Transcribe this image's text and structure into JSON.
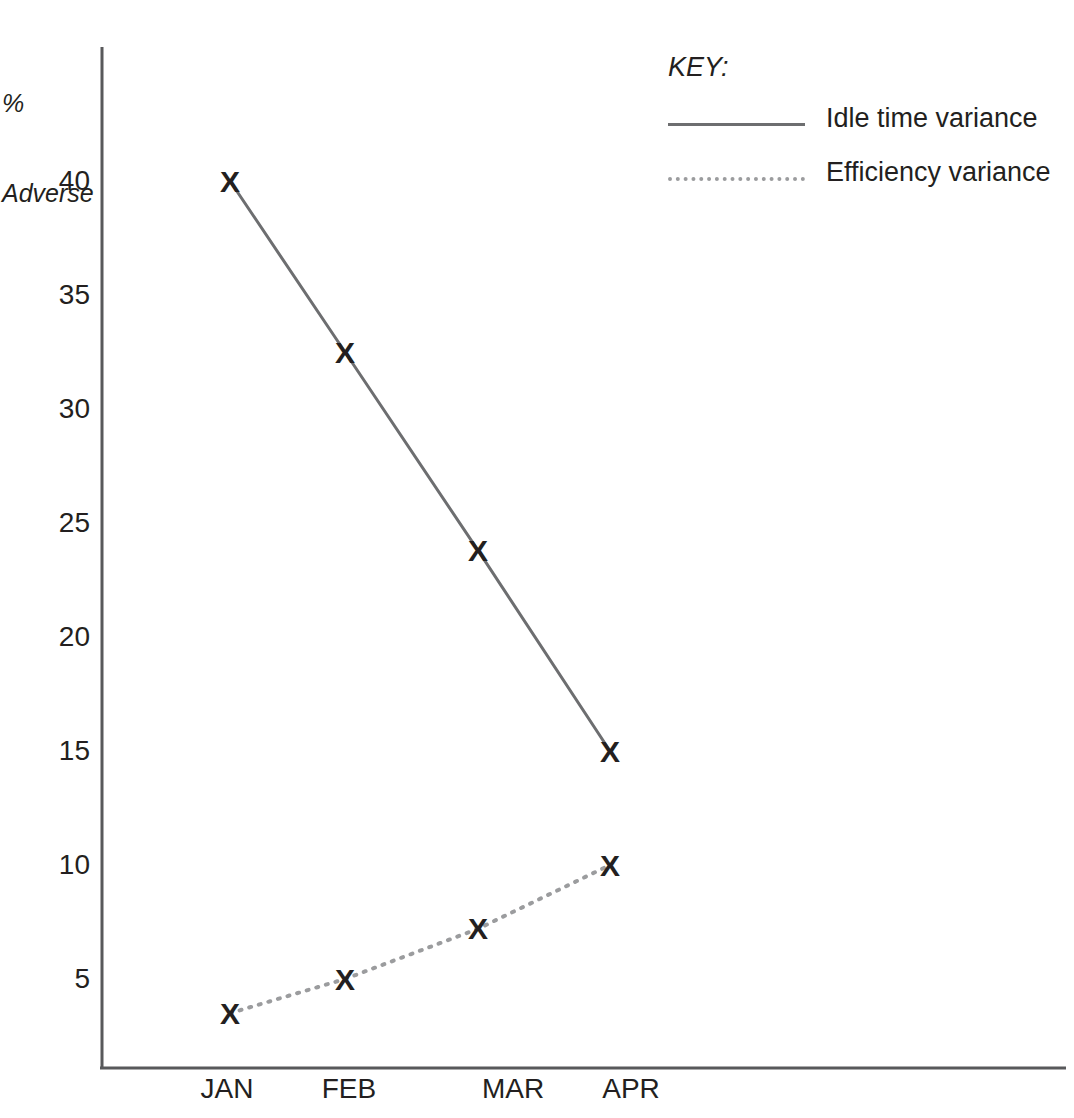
{
  "chart_data": {
    "type": "line",
    "title": "",
    "xlabel": "",
    "ylabel": "% Adverse",
    "categories": [
      "JAN",
      "FEB",
      "MAR",
      "APR"
    ],
    "ylim": [
      0,
      42
    ],
    "yticks": [
      5,
      10,
      15,
      20,
      25,
      30,
      35,
      40
    ],
    "grid": false,
    "legend_position": "top-right",
    "series": [
      {
        "name": "Idle time variance",
        "style": "solid",
        "color": "#6d6e70",
        "marker": "x",
        "values": [
          40,
          32.5,
          23.8,
          15
        ]
      },
      {
        "name": "Efficiency variance",
        "style": "dotted",
        "color": "#9b9c9e",
        "marker": "x",
        "values": [
          3.5,
          5,
          7.2,
          10
        ]
      }
    ]
  },
  "axis": {
    "y_title_line1": "%",
    "y_title_line2": "Adverse",
    "tick_0": "5",
    "tick_1": "10",
    "tick_2": "15",
    "tick_3": "20",
    "tick_4": "25",
    "tick_5": "30",
    "tick_6": "35",
    "tick_7": "40",
    "x_0": "JAN",
    "x_1": "FEB",
    "x_2": "MAR",
    "x_3": "APR"
  },
  "legend": {
    "title": "KEY:",
    "item_0": "Idle time variance",
    "item_1": "Efficiency variance"
  },
  "markers": {
    "glyph": "X"
  },
  "colors": {
    "axis": "#58595b",
    "series_solid": "#6d6e70",
    "series_dotted": "#9b9c9e",
    "text": "#231f20"
  }
}
